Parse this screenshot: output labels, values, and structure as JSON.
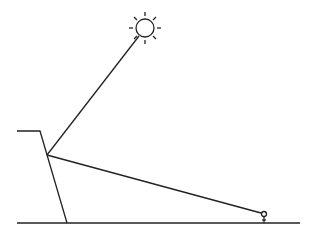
{
  "diagram": {
    "elements": {
      "sun": {
        "cx": 145,
        "cy": 28,
        "r": 9,
        "rays": 8
      },
      "cliff": {
        "top_left": [
          17,
          131
        ],
        "top_right": [
          40,
          131
        ],
        "base": [
          67,
          223
        ]
      },
      "ground": {
        "x1": 17,
        "x2": 300,
        "y": 223
      },
      "vertex": [
        47,
        155
      ],
      "person": {
        "x": 264,
        "y": 216
      },
      "line_to_sun": {
        "from": [
          47,
          155
        ],
        "to": [
          139,
          36
        ]
      },
      "line_to_person": {
        "from": [
          47,
          155
        ],
        "to": [
          261,
          213
        ]
      }
    },
    "stroke_color": "#222222"
  }
}
